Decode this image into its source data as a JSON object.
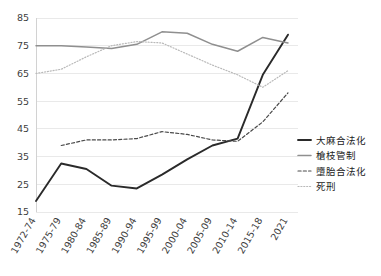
{
  "chart_data": {
    "type": "line",
    "title": "",
    "xlabel": "",
    "ylabel": "",
    "ylim": [
      15,
      85
    ],
    "yticks": [
      15,
      25,
      35,
      45,
      55,
      65,
      75,
      85
    ],
    "grid": true,
    "legend_position": "right",
    "categories": [
      "1972-74",
      "1975-79",
      "1980-84",
      "1985-89",
      "1990-94",
      "1995-99",
      "2000-04",
      "2005-09",
      "2010-14",
      "2015-18",
      "2021"
    ],
    "series": [
      {
        "name": "大麻合法化",
        "color": "#2a2a2a",
        "style": "solid",
        "width": 1.9,
        "values": [
          19,
          32.5,
          30.5,
          24.5,
          23.5,
          28.5,
          34,
          39,
          41.5,
          64.5,
          79
        ]
      },
      {
        "name": "槍枝管制",
        "color": "#8f8f8f",
        "style": "solid",
        "width": 1.5,
        "values": [
          75,
          75,
          74.5,
          74,
          75.5,
          80,
          79.5,
          75.5,
          73,
          78,
          76
        ]
      },
      {
        "name": "墮胎合法化",
        "color": "#4a4a4a",
        "style": "dashed",
        "width": 1.2,
        "values": [
          null,
          39,
          41,
          41,
          41.5,
          44,
          43,
          41,
          40.5,
          47.5,
          58
        ]
      },
      {
        "name": "死刑",
        "color": "#b9b9b9",
        "style": "dotted",
        "width": 1.2,
        "values": [
          65,
          66.5,
          71,
          75,
          76.5,
          76,
          72,
          68,
          64.5,
          60,
          66
        ]
      }
    ]
  },
  "legend": {
    "items": [
      {
        "label": "大麻合法化"
      },
      {
        "label": "槍枝管制"
      },
      {
        "label": "墮胎合法化"
      },
      {
        "label": "死刑"
      }
    ]
  }
}
